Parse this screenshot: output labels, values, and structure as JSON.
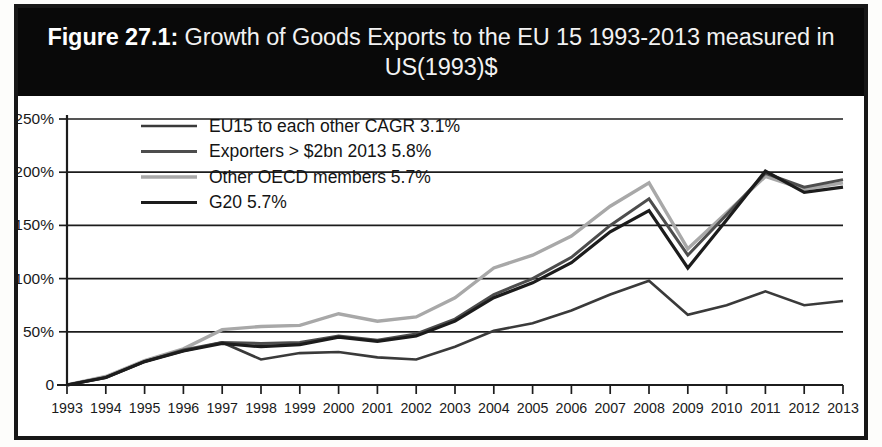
{
  "figure": {
    "label": "Figure 27.1:",
    "title_rest": " Growth of Goods Exports to the EU 15 1993-2013 measured in US(1993)$",
    "title_full": "Figure 27.1: Growth of Goods Exports to the EU 15 1993-2013 measured in US(1993)$",
    "banner_color": "#090909",
    "banner_text_color": "#ffffff"
  },
  "chart_data": {
    "type": "line",
    "title": "Growth of Goods Exports to the EU 15 1993-2013 measured in US(1993)$",
    "xlabel": "",
    "ylabel": "",
    "ylim": [
      0,
      250
    ],
    "yticks": [
      0,
      50,
      100,
      150,
      200,
      250
    ],
    "ytick_labels": [
      "0",
      "50%",
      "100%",
      "150%",
      "200%",
      "250%"
    ],
    "grid": true,
    "legend_position": "upper-left-inside",
    "categories": [
      "1993",
      "1994",
      "1995",
      "1996",
      "1997",
      "1998",
      "1999",
      "2000",
      "2001",
      "2002",
      "2003",
      "2004",
      "2005",
      "2006",
      "2007",
      "2008",
      "2009",
      "2010",
      "2011",
      "2012",
      "2013"
    ],
    "series": [
      {
        "name": "EU15 to each other CAGR 3.1%",
        "cagr": "3.1%",
        "color": "#3a3a3a",
        "width": 2.6,
        "values": [
          0,
          7,
          22,
          32,
          40,
          24,
          30,
          31,
          26,
          24,
          36,
          51,
          58,
          70,
          85,
          98,
          66,
          75,
          88,
          75,
          79
        ]
      },
      {
        "name": "Exporters > $2bn 2013 5.8%",
        "cagr": "5.8%",
        "color": "#4d4d4d",
        "width": 3.0,
        "values": [
          0,
          7,
          22,
          33,
          40,
          39,
          40,
          46,
          42,
          48,
          62,
          85,
          100,
          120,
          150,
          175,
          122,
          160,
          199,
          186,
          193
        ]
      },
      {
        "name": "Other OECD members 5.7%",
        "cagr": "5.7%",
        "color": "#a8a8a8",
        "width": 3.4,
        "values": [
          0,
          8,
          23,
          34,
          52,
          55,
          56,
          67,
          60,
          64,
          82,
          110,
          122,
          140,
          168,
          190,
          128,
          162,
          196,
          184,
          190
        ]
      },
      {
        "name": "G20 5.7%",
        "cagr": "5.7%",
        "color": "#1c1c1c",
        "width": 3.2,
        "values": [
          0,
          7,
          22,
          32,
          39,
          36,
          38,
          45,
          41,
          46,
          60,
          82,
          96,
          115,
          144,
          164,
          110,
          155,
          201,
          181,
          186
        ]
      }
    ]
  },
  "legend": {
    "items": [
      {
        "label": "EU15 to each other CAGR 3.1%",
        "swatch_color": "#3a3a3a"
      },
      {
        "label": "Exporters > $2bn 2013 5.8%",
        "swatch_color": "#4d4d4d"
      },
      {
        "label": "Other OECD members 5.7%",
        "swatch_color": "#a8a8a8"
      },
      {
        "label": "G20 5.7%",
        "swatch_color": "#1c1c1c"
      }
    ]
  }
}
